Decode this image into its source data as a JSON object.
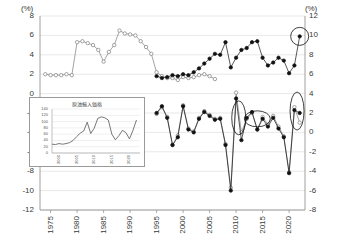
{
  "chart_data": {
    "type": "line",
    "title": "",
    "xlabel": "",
    "unit_left": "(%)",
    "unit_right": "(%)",
    "ylabel_left": "(%)",
    "ylabel_right": "(%)",
    "grid": true,
    "legend": "none",
    "xlim": [
      1973,
      2023
    ],
    "ylim_left": [
      -12,
      8
    ],
    "ylim_right": [
      -8,
      12
    ],
    "yticks_left": [
      "8",
      "6",
      "4",
      "2",
      "0",
      "-2",
      "-4",
      "-6",
      "-8",
      "-10",
      "-12"
    ],
    "yticks_left_values": [
      8,
      6,
      4,
      2,
      0,
      -2,
      -4,
      -6,
      -8,
      -10,
      -12
    ],
    "yticks_right": [
      "12",
      "10",
      "8",
      "6",
      "4",
      "2",
      "0",
      "-2",
      "-4",
      "-6",
      "-8"
    ],
    "yticks_right_values": [
      12,
      10,
      8,
      6,
      4,
      2,
      0,
      -2,
      -4,
      -6,
      -8
    ],
    "xticks": [
      "1975",
      "1980",
      "1985",
      "1990",
      "1995",
      "2000",
      "2005",
      "2010",
      "2015",
      "2020"
    ],
    "xticks_values": [
      1975,
      1980,
      1985,
      1990,
      1995,
      2000,
      2005,
      2010,
      2015,
      2020
    ],
    "series": [
      {
        "name": "upper-open-circles",
        "axis": "left",
        "marker": "open-circle",
        "color": "#7d7d7d",
        "x": [
          1974,
          1975,
          1976,
          1977,
          1978,
          1979,
          1980,
          1981,
          1982,
          1983,
          1984,
          1985,
          1986,
          1987,
          1988,
          1989,
          1990,
          1991,
          1992,
          1993,
          1994,
          1995,
          1996,
          1997,
          1998,
          1999,
          2000,
          2001,
          2002,
          2003,
          2004,
          2005,
          2006
        ],
        "values": [
          2.0,
          1.9,
          1.9,
          1.9,
          2.0,
          1.9,
          5.3,
          5.4,
          5.2,
          5.0,
          4.5,
          3.3,
          4.3,
          5.0,
          6.5,
          6.2,
          6.1,
          6.0,
          5.4,
          4.8,
          4.1,
          2.2,
          1.8,
          1.6,
          1.6,
          1.4,
          1.7,
          1.6,
          1.7,
          1.9,
          2.0,
          1.8,
          1.5
        ]
      },
      {
        "name": "upper-filled-circles",
        "axis": "right",
        "marker": "filled-circle",
        "color": "#111111",
        "x": [
          1995,
          1996,
          1997,
          1998,
          1999,
          2000,
          2001,
          2002,
          2003,
          2004,
          2005,
          2006,
          2007,
          2008,
          2009,
          2010,
          2011,
          2012,
          2013,
          2014,
          2015,
          2016,
          2017,
          2018,
          2019,
          2020,
          2021,
          2022
        ],
        "values": [
          5.8,
          5.6,
          5.7,
          5.9,
          5.8,
          6.0,
          5.9,
          6.2,
          6.6,
          7.1,
          7.6,
          8.1,
          8.0,
          9.3,
          6.7,
          7.7,
          8.5,
          8.7,
          9.3,
          9.4,
          7.7,
          6.9,
          7.2,
          7.7,
          7.4,
          6.1,
          6.9,
          9.9
        ]
      },
      {
        "name": "lower-open-circles",
        "axis": "right",
        "marker": "open-circle",
        "color": "#7d7d7d",
        "x": [
          1995,
          1996,
          1997,
          1998,
          1999,
          2000,
          2001,
          2002,
          2003,
          2004,
          2005,
          2006,
          2007,
          2008,
          2009,
          2010,
          2011,
          2012,
          2013,
          2014,
          2015,
          2016,
          2017,
          2018,
          2019,
          2020,
          2021,
          2022
        ],
        "values": [
          1.9,
          2.6,
          1.6,
          -1.3,
          -0.3,
          2.8,
          0.4,
          0.1,
          1.5,
          2.2,
          1.8,
          1.4,
          1.5,
          -1.2,
          -5.7,
          4.1,
          0.0,
          1.4,
          2.0,
          0.3,
          1.6,
          0.8,
          1.7,
          0.6,
          -0.4,
          -4.1,
          2.6,
          1.0
        ]
      },
      {
        "name": "lower-filled-circles",
        "axis": "right",
        "marker": "filled-circle",
        "color": "#111111",
        "x": [
          1995,
          1996,
          1997,
          1998,
          1999,
          2000,
          2001,
          2002,
          2003,
          2004,
          2005,
          2006,
          2007,
          2008,
          2009,
          2010,
          2011,
          2012,
          2013,
          2014,
          2015,
          2016,
          2017,
          2018,
          2019,
          2020,
          2021,
          2022
        ],
        "values": [
          2.0,
          2.7,
          1.5,
          -1.3,
          -0.5,
          2.7,
          0.3,
          0.0,
          1.4,
          2.1,
          1.7,
          1.3,
          1.4,
          -1.3,
          -6.0,
          3.5,
          -0.8,
          1.5,
          2.1,
          0.3,
          1.4,
          0.6,
          1.5,
          0.4,
          -0.5,
          -4.2,
          2.3,
          2.0
        ]
      }
    ],
    "annotations": [
      {
        "type": "ellipse",
        "name": "highlight-top-right-point",
        "x": 2022,
        "y": 9.9,
        "axis": "right"
      },
      {
        "type": "ellipse",
        "name": "highlight-2010-2011",
        "x": 2010.5,
        "y": 1.5,
        "axis": "right"
      },
      {
        "type": "ellipse",
        "name": "highlight-2013-2015",
        "x": 2014,
        "y": 1.4,
        "axis": "right"
      },
      {
        "type": "ellipse",
        "name": "highlight-2021-2022",
        "x": 2021.5,
        "y": 2.2,
        "axis": "right"
      }
    ],
    "inset": {
      "type": "line",
      "title": "原油輸入価格",
      "color": "#555555",
      "ylim": [
        0,
        140
      ],
      "yticks": [
        "140",
        "120",
        "100",
        "80",
        "60",
        "40",
        "20",
        "0"
      ],
      "yticks_values": [
        140,
        120,
        100,
        80,
        60,
        40,
        20,
        0
      ],
      "xticks": [
        "2000",
        "2005",
        "2010",
        "2015",
        "2020"
      ],
      "xticks_values": [
        2000,
        2005,
        2010,
        2015,
        2020
      ],
      "xlim": [
        1998,
        2023
      ],
      "x": [
        1998,
        1999,
        2000,
        2001,
        2002,
        2003,
        2004,
        2005,
        2006,
        2007,
        2008,
        2009,
        2010,
        2011,
        2012,
        2013,
        2014,
        2015,
        2016,
        2017,
        2018,
        2019,
        2020,
        2021,
        2022
      ],
      "values": [
        28,
        27,
        30,
        28,
        30,
        33,
        40,
        52,
        63,
        70,
        98,
        62,
        79,
        110,
        115,
        112,
        105,
        60,
        42,
        55,
        72,
        65,
        45,
        72,
        105
      ]
    }
  }
}
